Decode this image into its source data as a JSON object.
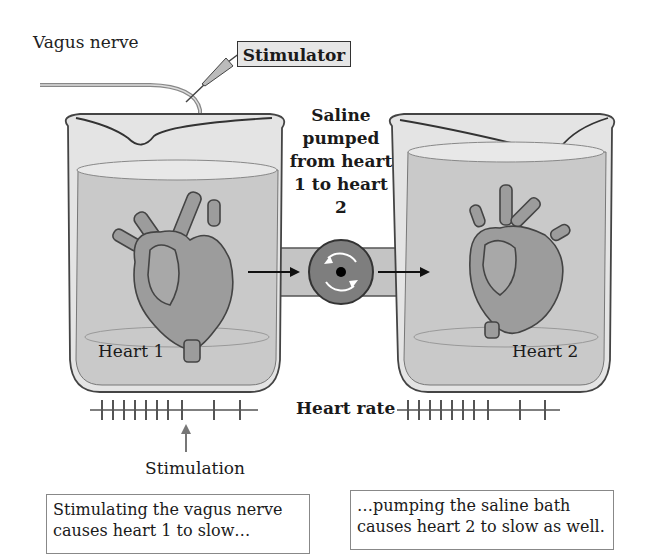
{
  "figure": {
    "labels": {
      "vagus_nerve": "Vagus nerve",
      "stimulator": "Stimulator",
      "saline_pumped": "Saline pumped from heart 1 to heart 2",
      "heart1": "Heart 1",
      "heart2": "Heart 2",
      "heart_rate": "Heart rate",
      "stimulation": "Stimulation"
    },
    "captions": {
      "left": "Stimulating the vagus nerve causes heart 1 to slow…",
      "right": "…pumping the saline bath causes heart 2 to slow as well."
    },
    "heart_rate_traces": {
      "heart1": {
        "ticks_fast": 8,
        "ticks_slow": 2
      },
      "heart2": {
        "ticks_fast": 8,
        "ticks_slow": 2
      }
    },
    "colors": {
      "beaker_fill": "#dcdcdc",
      "saline_fill": "#c9c9c9",
      "heart_fill": "#9a9a9a",
      "pump_fill": "#7a7a7a",
      "trace": "#555555"
    }
  }
}
